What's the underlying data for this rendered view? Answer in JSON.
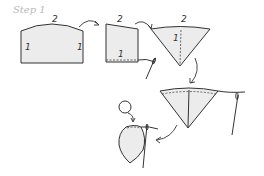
{
  "title": "Step 1",
  "labels": {
    "panel1_top": "2",
    "panel1_left": "1",
    "panel1_right": "1",
    "panel2_top": "2",
    "panel2_bottom": "1",
    "cone1_top": "2",
    "cone1_center": "1"
  }
}
